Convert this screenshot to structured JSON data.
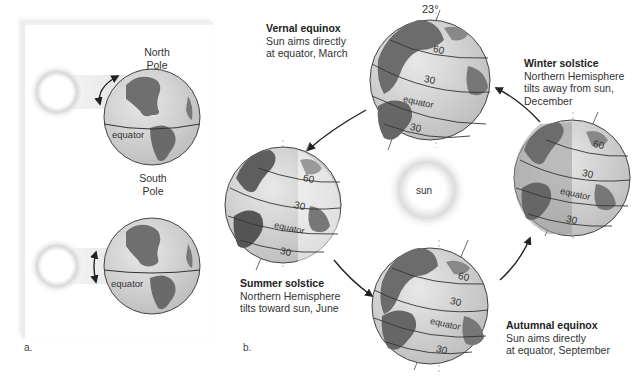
{
  "panel_a": {
    "letter": "a.",
    "north_pole": [
      "North",
      "Pole"
    ],
    "south_pole": [
      "South",
      "Pole"
    ],
    "equator_top": "equator",
    "equator_bottom": "equator"
  },
  "panel_b": {
    "letter": "b.",
    "sun_label": "sun",
    "tilt_label": "23°",
    "seasons": [
      {
        "title": "Vernal equinox",
        "line1": "Sun aims directly",
        "line2": "at equator, March"
      },
      {
        "title": "Winter solstice",
        "line1": "Northern Hemisphere",
        "line2": "tilts away from sun,",
        "line3": "December"
      },
      {
        "title": "Summer solstice",
        "line1": "Northern Hemisphere",
        "line2": "tilts toward sun, June"
      },
      {
        "title": "Autumnal equinox",
        "line1": "Sun aims directly",
        "line2": "at equator, September"
      }
    ],
    "latitudes": {
      "lat60": "60",
      "lat30": "30",
      "equator": "equator",
      "lat30s": "30"
    }
  },
  "colors": {
    "land": "#6b6b6b",
    "ocean": "#d4d4d4",
    "shadow": "#8a8a8a",
    "line": "#333333"
  }
}
